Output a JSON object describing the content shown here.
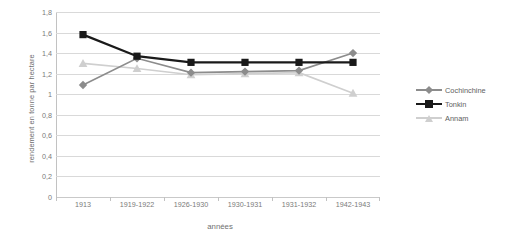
{
  "chart_data": {
    "type": "line",
    "title": "",
    "xlabel": "années",
    "ylabel": "rendement en tonne par hectare",
    "categories": [
      "1913",
      "1919-1922",
      "1926-1930",
      "1930-1931",
      "1931-1932",
      "1942-1943"
    ],
    "ylim": [
      0,
      1.8
    ],
    "yticks": [
      "0",
      "0,2",
      "0,4",
      "0,6",
      "0,8",
      "1",
      "1,2",
      "1,4",
      "1,6",
      "1,8"
    ],
    "ytick_values": [
      0,
      0.2,
      0.4,
      0.6,
      0.8,
      1.0,
      1.2,
      1.4,
      1.6,
      1.8
    ],
    "grid": true,
    "legend_position": "right",
    "series": [
      {
        "name": "Cochinchine",
        "color": "#8c8c8c",
        "marker": "diamond",
        "values": [
          1.09,
          1.35,
          1.21,
          1.22,
          1.23,
          1.4
        ]
      },
      {
        "name": "Tonkin",
        "color": "#1a1a1a",
        "marker": "square",
        "values": [
          1.58,
          1.37,
          1.31,
          1.31,
          1.31,
          1.31
        ]
      },
      {
        "name": "Annam",
        "color": "#cfcfcf",
        "marker": "triangle",
        "values": [
          1.3,
          1.25,
          1.19,
          1.2,
          1.21,
          1.01
        ]
      }
    ]
  },
  "axes": {
    "y_title": "rendement en tonne par hectare",
    "x_title": "années"
  },
  "legend": {
    "items": [
      {
        "label": "Cochinchine"
      },
      {
        "label": "Tonkin"
      },
      {
        "label": "Annam"
      }
    ]
  },
  "colors": {
    "cochinchine": "#8c8c8c",
    "tonkin": "#1a1a1a",
    "annam": "#cfcfcf",
    "gridline": "#d9d9d9",
    "axis": "#c2c2c2",
    "text": "#6f6f6f",
    "background": "#ffffff"
  }
}
